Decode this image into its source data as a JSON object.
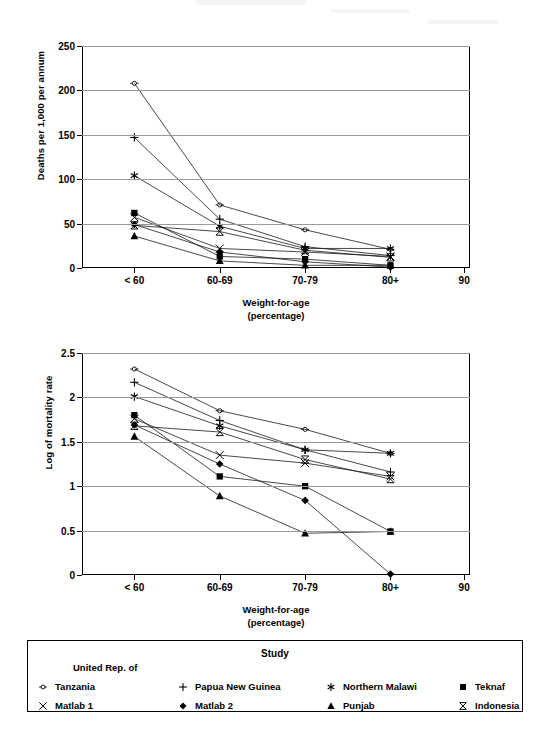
{
  "figure": {
    "background": "#ffffff",
    "ink": "#000000",
    "grid_color": "#9a9a9a"
  },
  "legend": {
    "title": "Study",
    "prefix_line": "United Rep. of",
    "items": [
      {
        "label": "Tanzania",
        "marker": "circle-dash-open",
        "key": "tanzania"
      },
      {
        "label": "Papua New Guinea",
        "marker": "plus",
        "key": "papua_new_guinea"
      },
      {
        "label": "Northern Malawi",
        "marker": "asterisk",
        "key": "northern_malawi"
      },
      {
        "label": "Teknaf",
        "marker": "square-filled",
        "key": "teknaf"
      },
      {
        "label": "Matlab 1",
        "marker": "x-cross",
        "key": "matlab_1"
      },
      {
        "label": "Matlab 2",
        "marker": "diamond-filled",
        "key": "matlab_2"
      },
      {
        "label": "Punjab",
        "marker": "triangle-filled",
        "key": "punjab"
      },
      {
        "label": "Indonesia",
        "marker": "bowtie-open",
        "key": "indonesia"
      }
    ]
  },
  "chart_data": [
    {
      "id": "deaths-per-1000",
      "type": "line",
      "title": "",
      "xlabel": "Weight-for-age",
      "xlabel_sub": "(percentage)",
      "ylabel": "Deaths per 1,000 per annum",
      "categories": [
        "< 60",
        "60-69",
        "70-79",
        "80+"
      ],
      "xtick_labels": [
        "< 60",
        "60-69",
        "70-79",
        "80+",
        "90"
      ],
      "ytick_labels": [
        "0",
        "50",
        "100",
        "150",
        "200",
        "250"
      ],
      "yticks": [
        0,
        50,
        100,
        150,
        200,
        250
      ],
      "ylim": [
        0,
        250
      ],
      "grid": "horizontal",
      "legend_position": "below-figure",
      "series": [
        {
          "name": "Tanzania",
          "marker": "circle-dash-open",
          "values": [
            208,
            71,
            43,
            21
          ]
        },
        {
          "name": "Papua New Guinea",
          "marker": "plus",
          "values": [
            147,
            55,
            24,
            14
          ]
        },
        {
          "name": "Northern Malawi",
          "marker": "asterisk",
          "values": [
            104,
            47,
            22,
            22
          ]
        },
        {
          "name": "Teknaf",
          "marker": "square-filled",
          "values": [
            62,
            13,
            10,
            3
          ]
        },
        {
          "name": "Matlab 1",
          "marker": "x-cross",
          "values": [
            57,
            22,
            18,
            13
          ]
        },
        {
          "name": "Matlab 2",
          "marker": "diamond-filled",
          "values": [
            49,
            18,
            7,
            1
          ]
        },
        {
          "name": "Punjab",
          "marker": "triangle-filled",
          "values": [
            36,
            8,
            3,
            3
          ]
        },
        {
          "name": "Indonesia",
          "marker": "bowtie-open",
          "values": [
            48,
            41,
            20,
            12
          ]
        }
      ]
    },
    {
      "id": "log-mortality-rate",
      "type": "line",
      "title": "",
      "xlabel": "Weight-for-age",
      "xlabel_sub": "(percentage)",
      "ylabel": "Log of mortality rate",
      "categories": [
        "< 60",
        "60-69",
        "70-79",
        "80+"
      ],
      "xtick_labels": [
        "< 60",
        "60-69",
        "70-79",
        "80+",
        "90"
      ],
      "ytick_labels": [
        "0",
        "0.5",
        "1",
        "1.5",
        "2",
        "2.5"
      ],
      "yticks": [
        0,
        0.5,
        1,
        1.5,
        2,
        2.5
      ],
      "ylim": [
        0,
        2.5
      ],
      "grid": "horizontal",
      "legend_position": "below-figure",
      "series": [
        {
          "name": "Tanzania",
          "marker": "circle-dash-open",
          "values": [
            2.32,
            1.85,
            1.64,
            1.37
          ]
        },
        {
          "name": "Papua New Guinea",
          "marker": "plus",
          "values": [
            2.17,
            1.74,
            1.41,
            1.16
          ]
        },
        {
          "name": "Northern Malawi",
          "marker": "asterisk",
          "values": [
            2.01,
            1.68,
            1.41,
            1.37
          ]
        },
        {
          "name": "Teknaf",
          "marker": "square-filled",
          "values": [
            1.8,
            1.11,
            1.0,
            0.49
          ]
        },
        {
          "name": "Matlab 1",
          "marker": "x-cross",
          "values": [
            1.76,
            1.35,
            1.26,
            1.11
          ]
        },
        {
          "name": "Matlab 2",
          "marker": "diamond-filled",
          "values": [
            1.69,
            1.25,
            0.84,
            0.01
          ]
        },
        {
          "name": "Punjab",
          "marker": "triangle-filled",
          "values": [
            1.56,
            0.89,
            0.47,
            0.49
          ]
        },
        {
          "name": "Indonesia",
          "marker": "bowtie-open",
          "values": [
            1.68,
            1.61,
            1.3,
            1.08
          ]
        }
      ]
    }
  ]
}
